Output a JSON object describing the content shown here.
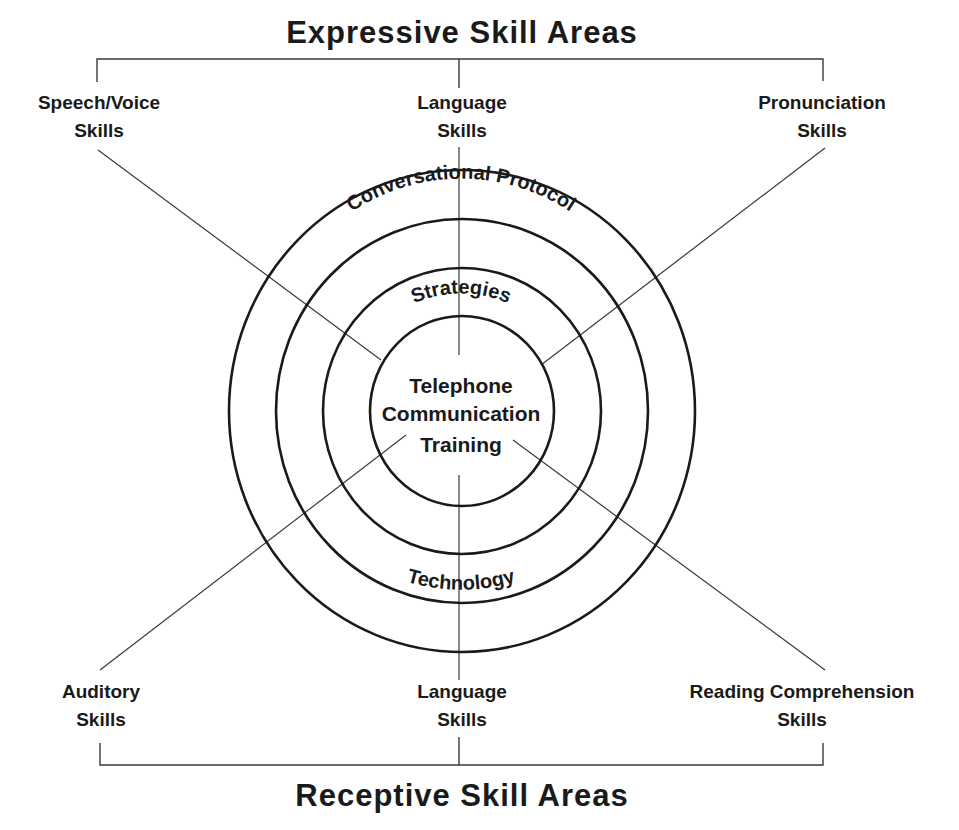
{
  "diagram": {
    "top_title": "Expressive Skill Areas",
    "bottom_title": "Receptive Skill Areas",
    "core": {
      "lines": [
        "Telephone",
        "Communication",
        "Training"
      ]
    },
    "rings": [
      {
        "name": "strategies",
        "label": "Strategies",
        "position": "top"
      },
      {
        "name": "conversational-protocol",
        "label": "Conversational Protocol",
        "position": "top"
      },
      {
        "name": "technology",
        "label": "Technology",
        "position": "bottom"
      }
    ],
    "expressive_skills": [
      {
        "name": "speech-voice",
        "line1": "Speech/Voice",
        "line2": "Skills"
      },
      {
        "name": "language-expressive",
        "line1": "Language",
        "line2": "Skills"
      },
      {
        "name": "pronunciation",
        "line1": "Pronunciation",
        "line2": "Skills"
      }
    ],
    "receptive_skills": [
      {
        "name": "auditory",
        "line1": "Auditory",
        "line2": "Skills"
      },
      {
        "name": "language-receptive",
        "line1": "Language",
        "line2": "Skills"
      },
      {
        "name": "reading-comprehension",
        "line1": "Reading Comprehension",
        "line2": "Skills"
      }
    ],
    "colors": {
      "ink": "#1a1a1a",
      "line": "#3a3a3a",
      "background": "#ffffff"
    }
  }
}
